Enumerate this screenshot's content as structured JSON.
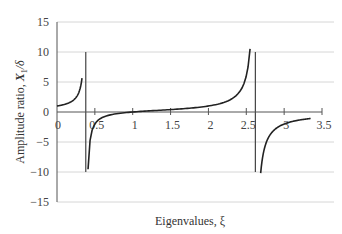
{
  "chart_data": {
    "type": "line",
    "title": "",
    "xlabel": "Eigenvalues, ξ",
    "ylabel": "Amplitude ratio, X₁/δ",
    "xlim": [
      0,
      3.5
    ],
    "ylim": [
      -15,
      15
    ],
    "x_ticks": [
      "0",
      "0.5",
      "1",
      "1.5",
      "2",
      "2.5",
      "3",
      "3.5"
    ],
    "y_ticks": [
      "15",
      "10",
      "5",
      "0",
      "−5",
      "−10",
      "−15"
    ],
    "grid": "horizontal",
    "legend": "none",
    "asymptotes": [
      0.38,
      2.62
    ],
    "series": [
      {
        "name": "branch-1",
        "x": [
          0,
          0.1,
          0.2,
          0.25,
          0.3,
          0.33
        ],
        "y": [
          1.0,
          1.27,
          1.9,
          2.4,
          3.7,
          5.5
        ]
      },
      {
        "name": "branch-2",
        "x": [
          0.41,
          0.5,
          0.6,
          0.75,
          1.0,
          1.25,
          1.5,
          1.75,
          2.0,
          2.25,
          2.4,
          2.5,
          2.55
        ],
        "y": [
          -5.3,
          -2.0,
          -0.95,
          -0.45,
          0.0,
          0.2,
          0.4,
          0.6,
          1.0,
          2.0,
          3.4,
          6.0,
          10.5
        ]
      },
      {
        "name": "branch-3",
        "x": [
          2.69,
          2.75,
          2.85,
          3.0,
          3.15,
          3.3,
          3.35
        ],
        "y": [
          -9.3,
          -4.1,
          -2.7,
          -2.0,
          -1.6,
          -1.3,
          -1.2
        ]
      }
    ]
  },
  "labels": {
    "xlabel": "Eigenvalues, ξ",
    "ylabel_prefix": "Amplitude ratio, ",
    "ylabel_var": "X",
    "ylabel_sub": "1",
    "ylabel_suffix": "/δ"
  }
}
